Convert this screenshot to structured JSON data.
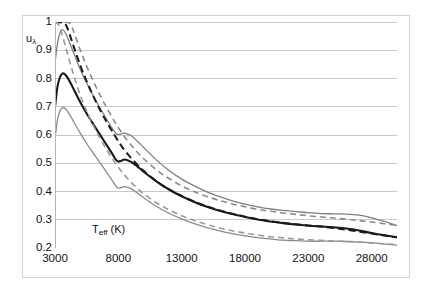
{
  "figure": {
    "background": "#ffffff",
    "frame_color": "#d2d2d2",
    "gridline_color": "#c9c9c9"
  },
  "axis": {
    "y_title_main": "u",
    "y_title_sub": "λ",
    "x_title_main": "T",
    "x_title_sub": "eff",
    "x_title_unit": " (K)",
    "y_ticks": [
      "1",
      "0.9",
      "0.8",
      "0.7",
      "0.6",
      "0.5",
      "0.4",
      "0.3",
      "0.2"
    ],
    "x_ticks": [
      "3000",
      "8000",
      "13000",
      "18000",
      "23000",
      "28000"
    ]
  },
  "chart_data": {
    "type": "line",
    "title": "",
    "xlabel": "T_eff (K)",
    "ylabel": "u_lambda",
    "xlim": [
      3000,
      30000
    ],
    "ylim": [
      0.2,
      1.0
    ],
    "xticks": [
      3000,
      8000,
      13000,
      18000,
      23000,
      28000
    ],
    "yticks": [
      0.2,
      0.3,
      0.4,
      0.5,
      0.6,
      0.7,
      0.8,
      0.9,
      1.0
    ],
    "grid": "horizontal",
    "legend": "none",
    "x": [
      3000,
      3200,
      3400,
      3600,
      3800,
      4000,
      4250,
      4500,
      5000,
      5500,
      6000,
      6500,
      7000,
      7500,
      7800,
      8000,
      8250,
      8500,
      9000,
      9500,
      10000,
      11000,
      12000,
      13000,
      14000,
      15000,
      16000,
      17000,
      18000,
      19000,
      20000,
      21000,
      22000,
      23000,
      24000,
      25000,
      26000,
      27000,
      28000,
      29000,
      30000
    ],
    "series": [
      {
        "name": "upper-envelope-solid-gray",
        "style": "solid",
        "color": "#7f7f7f",
        "width": 1.3,
        "values": [
          0.855,
          0.925,
          0.962,
          0.972,
          0.963,
          0.944,
          0.916,
          0.888,
          0.832,
          0.784,
          0.74,
          0.7,
          0.662,
          0.624,
          0.606,
          0.602,
          0.604,
          0.607,
          0.598,
          0.578,
          0.556,
          0.512,
          0.474,
          0.444,
          0.42,
          0.399,
          0.382,
          0.367,
          0.355,
          0.346,
          0.338,
          0.333,
          0.329,
          0.325,
          0.322,
          0.321,
          0.32,
          0.316,
          0.307,
          0.294,
          0.279
        ]
      },
      {
        "name": "upper-dashed-gray",
        "style": "dashed",
        "color": "#8c8c8c",
        "width": 1.6,
        "values": [
          0.999,
          0.999,
          0.999,
          0.999,
          0.999,
          0.999,
          0.992,
          0.963,
          0.9,
          0.844,
          0.793,
          0.746,
          0.703,
          0.663,
          0.64,
          0.626,
          0.609,
          0.593,
          0.565,
          0.539,
          0.516,
          0.477,
          0.446,
          0.42,
          0.399,
          0.382,
          0.368,
          0.356,
          0.346,
          0.337,
          0.33,
          0.324,
          0.319,
          0.314,
          0.31,
          0.306,
          0.302,
          0.297,
          0.292,
          0.286,
          0.28
        ]
      },
      {
        "name": "mean-solid-black",
        "style": "solid",
        "color": "#1a1a1a",
        "width": 2.1,
        "values": [
          0.7,
          0.772,
          0.806,
          0.818,
          0.814,
          0.802,
          0.782,
          0.76,
          0.716,
          0.676,
          0.64,
          0.605,
          0.57,
          0.535,
          0.513,
          0.506,
          0.509,
          0.513,
          0.505,
          0.489,
          0.47,
          0.436,
          0.407,
          0.383,
          0.363,
          0.346,
          0.332,
          0.32,
          0.31,
          0.301,
          0.294,
          0.288,
          0.283,
          0.279,
          0.276,
          0.273,
          0.269,
          0.262,
          0.253,
          0.245,
          0.238
        ]
      },
      {
        "name": "mean-dashed-black",
        "style": "dashed",
        "color": "#1a1a1a",
        "width": 2.0,
        "values": [
          0.999,
          0.999,
          0.999,
          0.998,
          0.994,
          0.976,
          0.944,
          0.91,
          0.846,
          0.79,
          0.74,
          0.694,
          0.652,
          0.614,
          0.592,
          0.578,
          0.561,
          0.546,
          0.519,
          0.495,
          0.473,
          0.437,
          0.408,
          0.384,
          0.364,
          0.347,
          0.333,
          0.321,
          0.311,
          0.302,
          0.295,
          0.289,
          0.284,
          0.28,
          0.276,
          0.271,
          0.265,
          0.258,
          0.251,
          0.244,
          0.238
        ]
      },
      {
        "name": "lower-envelope-solid-gray",
        "style": "solid",
        "color": "#8a8a8a",
        "width": 1.3,
        "values": [
          0.588,
          0.654,
          0.686,
          0.697,
          0.694,
          0.683,
          0.665,
          0.645,
          0.606,
          0.57,
          0.537,
          0.505,
          0.473,
          0.44,
          0.42,
          0.412,
          0.414,
          0.417,
          0.41,
          0.395,
          0.378,
          0.348,
          0.323,
          0.303,
          0.286,
          0.272,
          0.261,
          0.251,
          0.243,
          0.237,
          0.232,
          0.228,
          0.226,
          0.224,
          0.224,
          0.224,
          0.223,
          0.221,
          0.218,
          0.214,
          0.21
        ]
      },
      {
        "name": "lower-dashed-gray",
        "style": "dashed",
        "color": "#9a9a9a",
        "width": 1.6,
        "values": [
          0.999,
          0.996,
          0.978,
          0.95,
          0.918,
          0.886,
          0.846,
          0.808,
          0.74,
          0.684,
          0.636,
          0.593,
          0.554,
          0.518,
          0.498,
          0.486,
          0.471,
          0.457,
          0.433,
          0.411,
          0.392,
          0.36,
          0.335,
          0.314,
          0.297,
          0.283,
          0.271,
          0.261,
          0.253,
          0.246,
          0.24,
          0.236,
          0.232,
          0.229,
          0.227,
          0.225,
          0.223,
          0.221,
          0.218,
          0.215,
          0.212
        ]
      }
    ]
  }
}
